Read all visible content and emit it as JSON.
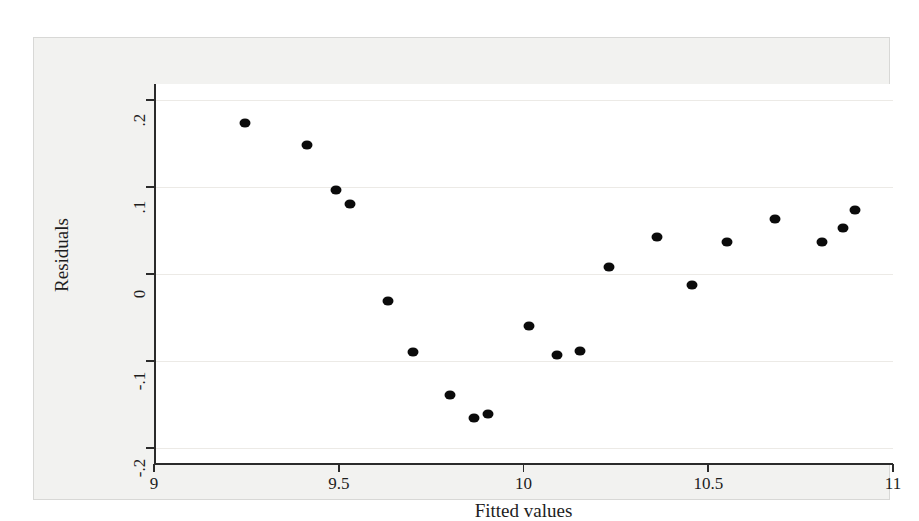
{
  "chart_data": {
    "type": "scatter",
    "title": "",
    "xlabel": "Fitted values",
    "ylabel": "Residuals",
    "xlim": [
      9,
      11
    ],
    "ylim": [
      -0.2,
      0.2
    ],
    "xticks": [
      "9",
      "9.5",
      "10",
      "10.5",
      "11"
    ],
    "xtick_values": [
      9,
      9.5,
      10,
      10.5,
      11
    ],
    "yticks": [
      ".2",
      ".1",
      "0",
      "-.1",
      "-.2"
    ],
    "ytick_values": [
      0.2,
      0.1,
      0,
      -0.1,
      -0.2
    ],
    "grid": true,
    "grid_axis": "y",
    "legend": null,
    "marker_color": "#0b0b0b",
    "marker_shape": "circle",
    "background_color": "#ffffff",
    "frame_color": "#f2f2f0",
    "points": [
      {
        "x": 9.247,
        "y": 0.174
      },
      {
        "x": 9.415,
        "y": 0.148
      },
      {
        "x": 9.493,
        "y": 0.096
      },
      {
        "x": 9.531,
        "y": 0.081
      },
      {
        "x": 9.634,
        "y": -0.031
      },
      {
        "x": 9.702,
        "y": -0.09
      },
      {
        "x": 9.802,
        "y": -0.139
      },
      {
        "x": 9.867,
        "y": -0.165
      },
      {
        "x": 9.905,
        "y": -0.161
      },
      {
        "x": 10.016,
        "y": -0.06
      },
      {
        "x": 10.092,
        "y": -0.093
      },
      {
        "x": 10.152,
        "y": -0.089
      },
      {
        "x": 10.232,
        "y": 0.008
      },
      {
        "x": 10.362,
        "y": 0.043
      },
      {
        "x": 10.457,
        "y": -0.013
      },
      {
        "x": 10.552,
        "y": 0.037
      },
      {
        "x": 10.68,
        "y": 0.063
      },
      {
        "x": 10.808,
        "y": 0.037
      },
      {
        "x": 10.865,
        "y": 0.053
      },
      {
        "x": 10.898,
        "y": 0.074
      }
    ]
  }
}
